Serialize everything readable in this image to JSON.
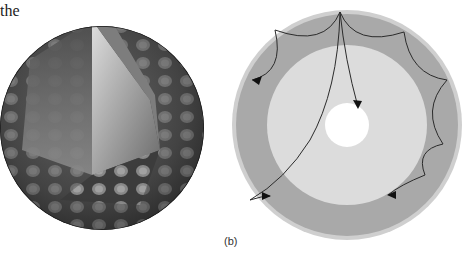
{
  "text_fragment": "the",
  "figures": {
    "a": {
      "description": "3D sphere cutaway with standing-wave oscillation pattern",
      "colors": {
        "dark": "#2a2a2a",
        "light": "#9a9a9a"
      }
    },
    "b": {
      "label": "(b)",
      "description": "Cross-section of sphere showing ray paths of acoustic waves refracting in interior",
      "colors": {
        "outer_ring": "#a9a9a9",
        "outer_edge": "#cfcfcf",
        "inner_region": "#dcdcdc",
        "core": "#ffffff",
        "ray": "#2b2b2b"
      }
    }
  }
}
